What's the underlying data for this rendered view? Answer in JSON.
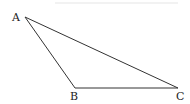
{
  "diagram": {
    "type": "triangle",
    "vertices": [
      {
        "label": "A",
        "x": 25,
        "y": 17
      },
      {
        "label": "B",
        "x": 75,
        "y": 88
      },
      {
        "label": "C",
        "x": 178,
        "y": 88
      }
    ],
    "edges": [
      [
        "A",
        "B"
      ],
      [
        "B",
        "C"
      ],
      [
        "C",
        "A"
      ]
    ],
    "stroke_color": "#333333"
  }
}
